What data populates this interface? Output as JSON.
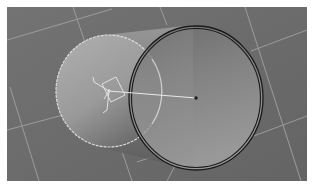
{
  "viewport": {
    "background": "#6b6b6b",
    "grid_color": "#9a9a9a",
    "object": {
      "type": "cylinder",
      "selected_face_outline_color": "#d8d8d8",
      "rim_color": "#1e1e1e",
      "front_face_color": "#8a8a8a",
      "back_face_color": "#a4a4a4"
    },
    "gizmo": {
      "type": "transform-gizmo",
      "color": "#e0e0e0"
    },
    "pivot_line_color": "#e6e6e6",
    "center_point_color": "#202020"
  }
}
